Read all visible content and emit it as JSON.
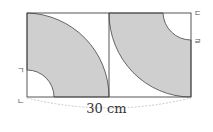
{
  "diagram": {
    "type": "geometry",
    "measurement_label": "30 cm",
    "point_labels": {
      "a": "ㄱ",
      "b": "ㄴ",
      "c": "ㄷ",
      "d": "ㄹ"
    },
    "colors": {
      "shade": "#cfcfcf",
      "stroke": "#444444",
      "dashed": "#bbbbbb"
    }
  }
}
